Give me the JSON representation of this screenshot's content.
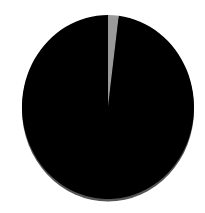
{
  "chart_data": {
    "type": "pie",
    "title": "",
    "categories": [
      "Slice A",
      "Slice B"
    ],
    "values": [
      98,
      2
    ],
    "colors": [
      "#000000",
      "#9a9a9a"
    ],
    "start_angle_deg": 0,
    "direction": "clockwise",
    "legend": "none",
    "labels_shown": false,
    "rim_color": "#555555"
  }
}
